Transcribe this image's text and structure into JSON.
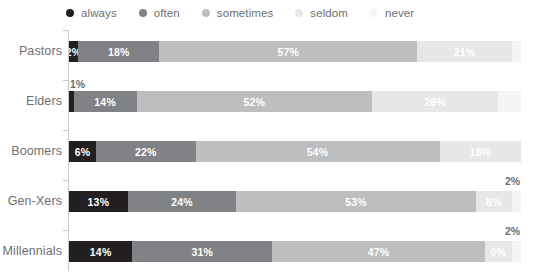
{
  "legend": {
    "items": [
      {
        "label": "always",
        "color": "#231f20"
      },
      {
        "label": "often",
        "color": "#808285"
      },
      {
        "label": "sometimes",
        "color": "#bcbec0"
      },
      {
        "label": "seldom",
        "color": "#e6e7e8"
      },
      {
        "label": "never",
        "color": "#f4f4f5"
      }
    ]
  },
  "chart_data": {
    "type": "bar",
    "orientation": "horizontal",
    "stacked": true,
    "normalized": true,
    "title": "",
    "xlabel": "",
    "ylabel": "",
    "xlim": [
      0,
      100
    ],
    "grid": false,
    "legend_position": "top",
    "categories": [
      "Pastors",
      "Elders",
      "Boomers",
      "Gen-Xers",
      "Millennials"
    ],
    "series": [
      {
        "name": "always",
        "color": "#231f20",
        "values": [
          2,
          1,
          6,
          13,
          14
        ]
      },
      {
        "name": "often",
        "color": "#808285",
        "values": [
          18,
          14,
          22,
          24,
          31
        ]
      },
      {
        "name": "sometimes",
        "color": "#bcbec0",
        "values": [
          57,
          52,
          54,
          53,
          47
        ]
      },
      {
        "name": "seldom",
        "color": "#e6e7e8",
        "values": [
          21,
          28,
          18,
          8,
          6
        ]
      },
      {
        "name": "never",
        "color": "#f4f4f5",
        "values": [
          2,
          5,
          0,
          2,
          2
        ]
      }
    ],
    "rows": [
      {
        "category": "Pastors",
        "segments": [
          {
            "series": "always",
            "value": 2,
            "label": "2%",
            "label_position": "inside",
            "label_color": "#ffffff"
          },
          {
            "series": "often",
            "value": 18,
            "label": "18%",
            "label_position": "inside",
            "label_color": "#ffffff"
          },
          {
            "series": "sometimes",
            "value": 57,
            "label": "57%",
            "label_position": "inside",
            "label_color": "#ffffff"
          },
          {
            "series": "seldom",
            "value": 21,
            "label": "21%",
            "label_position": "inside",
            "label_color": "#ffffff"
          },
          {
            "series": "never",
            "value": 2,
            "label": "",
            "label_position": "none",
            "label_color": "#6d6e71"
          }
        ],
        "callout": {
          "text": "",
          "visible": false
        }
      },
      {
        "category": "Elders",
        "segments": [
          {
            "series": "always",
            "value": 1,
            "label": "",
            "label_position": "above",
            "label_color": "#6d6e71"
          },
          {
            "series": "often",
            "value": 14,
            "label": "14%",
            "label_position": "inside",
            "label_color": "#ffffff"
          },
          {
            "series": "sometimes",
            "value": 52,
            "label": "52%",
            "label_position": "inside",
            "label_color": "#ffffff"
          },
          {
            "series": "seldom",
            "value": 28,
            "label": "28%",
            "label_position": "inside",
            "label_color": "#ffffff"
          },
          {
            "series": "never",
            "value": 5,
            "label": "",
            "label_position": "none",
            "label_color": "#6d6e71"
          }
        ],
        "callout": {
          "text": "1%",
          "visible": true
        }
      },
      {
        "category": "Boomers",
        "segments": [
          {
            "series": "always",
            "value": 6,
            "label": "6%",
            "label_position": "inside",
            "label_color": "#ffffff"
          },
          {
            "series": "often",
            "value": 22,
            "label": "22%",
            "label_position": "inside",
            "label_color": "#ffffff"
          },
          {
            "series": "sometimes",
            "value": 54,
            "label": "54%",
            "label_position": "inside",
            "label_color": "#ffffff"
          },
          {
            "series": "seldom",
            "value": 18,
            "label": "18%",
            "label_position": "inside",
            "label_color": "#ffffff"
          },
          {
            "series": "never",
            "value": 0,
            "label": "",
            "label_position": "none",
            "label_color": "#6d6e71"
          }
        ],
        "callout": {
          "text": "",
          "visible": false
        }
      },
      {
        "category": "Gen-Xers",
        "segments": [
          {
            "series": "always",
            "value": 13,
            "label": "13%",
            "label_position": "inside",
            "label_color": "#ffffff"
          },
          {
            "series": "often",
            "value": 24,
            "label": "24%",
            "label_position": "inside",
            "label_color": "#ffffff"
          },
          {
            "series": "sometimes",
            "value": 53,
            "label": "53%",
            "label_position": "inside",
            "label_color": "#ffffff"
          },
          {
            "series": "seldom",
            "value": 8,
            "label": "8%",
            "label_position": "inside",
            "label_color": "#ffffff"
          },
          {
            "series": "never",
            "value": 2,
            "label": "",
            "label_position": "above",
            "label_color": "#6d6e71"
          }
        ],
        "callout": {
          "text": "2%",
          "visible": true
        }
      },
      {
        "category": "Millennials",
        "segments": [
          {
            "series": "always",
            "value": 14,
            "label": "14%",
            "label_position": "inside",
            "label_color": "#ffffff"
          },
          {
            "series": "often",
            "value": 31,
            "label": "31%",
            "label_position": "inside",
            "label_color": "#ffffff"
          },
          {
            "series": "sometimes",
            "value": 47,
            "label": "47%",
            "label_position": "inside",
            "label_color": "#ffffff"
          },
          {
            "series": "seldom",
            "value": 6,
            "label": "6%",
            "label_position": "inside",
            "label_color": "#ffffff"
          },
          {
            "series": "never",
            "value": 2,
            "label": "",
            "label_position": "above",
            "label_color": "#6d6e71"
          }
        ],
        "callout": {
          "text": "2%",
          "visible": true
        }
      }
    ]
  }
}
